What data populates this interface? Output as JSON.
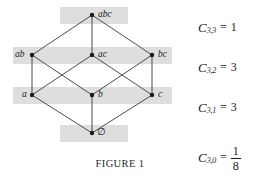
{
  "figure": {
    "caption": "FIGURE 1"
  },
  "diagram": {
    "band_color": "#dedede",
    "edge_color": "#4a4a4a",
    "node_color": "#1b1b1b",
    "nodes": [
      {
        "id": "abc",
        "label": "abc",
        "x": 92,
        "y": 15,
        "label_dx": 6,
        "label_dy": -5,
        "rank": 3
      },
      {
        "id": "ab",
        "label": "ab",
        "x": 32,
        "y": 55,
        "label_dx": -17,
        "label_dy": -5,
        "rank": 2
      },
      {
        "id": "ac",
        "label": "ac",
        "x": 92,
        "y": 55,
        "label_dx": 6,
        "label_dy": -5,
        "rank": 2
      },
      {
        "id": "bc",
        "label": "bc",
        "x": 152,
        "y": 55,
        "label_dx": 6,
        "label_dy": -5,
        "rank": 2
      },
      {
        "id": "a",
        "label": "a",
        "x": 32,
        "y": 95,
        "label_dx": -10,
        "label_dy": -5,
        "rank": 1
      },
      {
        "id": "b",
        "label": "b",
        "x": 92,
        "y": 95,
        "label_dx": 6,
        "label_dy": -5,
        "rank": 1
      },
      {
        "id": "c",
        "label": "c",
        "x": 152,
        "y": 95,
        "label_dx": 6,
        "label_dy": -5,
        "rank": 1
      },
      {
        "id": "empty",
        "label": "∅",
        "x": 92,
        "y": 133,
        "label_dx": 5,
        "label_dy": -6,
        "rank": 0
      }
    ],
    "edges": [
      [
        "abc",
        "ab"
      ],
      [
        "abc",
        "ac"
      ],
      [
        "abc",
        "bc"
      ],
      [
        "ab",
        "a"
      ],
      [
        "ab",
        "b"
      ],
      [
        "ac",
        "a"
      ],
      [
        "ac",
        "c"
      ],
      [
        "bc",
        "b"
      ],
      [
        "bc",
        "c"
      ],
      [
        "a",
        "empty"
      ],
      [
        "b",
        "empty"
      ],
      [
        "c",
        "empty"
      ]
    ],
    "bands": [
      {
        "name": "rank-3-band",
        "x": 60,
        "y": 7,
        "w": 68,
        "h": 17
      },
      {
        "name": "rank-2-band",
        "x": 13,
        "y": 47,
        "w": 159,
        "h": 17
      },
      {
        "name": "rank-1-band",
        "x": 13,
        "y": 87,
        "w": 159,
        "h": 17
      },
      {
        "name": "rank-0-band",
        "x": 60,
        "y": 125,
        "w": 68,
        "h": 17
      }
    ]
  },
  "equations": [
    {
      "symbol": "C",
      "subscript": "3,3",
      "equals": "=",
      "value": "1",
      "is_fraction": false,
      "y": 20
    },
    {
      "symbol": "C",
      "subscript": "3,2",
      "equals": "=",
      "value": "3",
      "is_fraction": false,
      "y": 60
    },
    {
      "symbol": "C",
      "subscript": "3,1",
      "equals": "=",
      "value": "3",
      "is_fraction": false,
      "y": 100
    },
    {
      "symbol": "C",
      "subscript": "3,0",
      "equals": "=",
      "numerator": "1",
      "denominator": "8",
      "is_fraction": true,
      "y": 144
    }
  ]
}
